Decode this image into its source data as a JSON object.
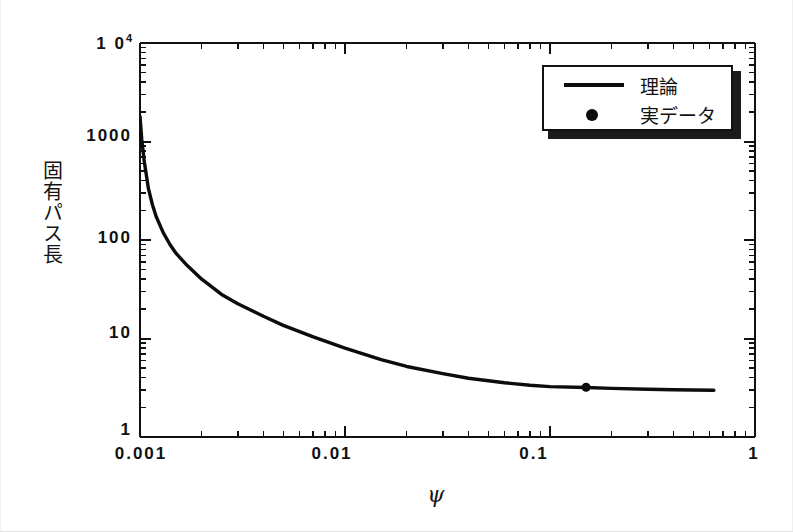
{
  "figure": {
    "background_color": "#ffffff",
    "ink_color": "#111111"
  },
  "axis": {
    "y_title": "固有パス長",
    "x_title": "ψ",
    "y_tick_labels": [
      "1",
      "10",
      "100",
      "1000",
      "10"
    ],
    "y_top_exponent": "4",
    "x_tick_labels": [
      "0.001",
      "0.01",
      "0.1",
      "1"
    ]
  },
  "legend": {
    "items": [
      {
        "label": "理論",
        "marker": "line",
        "color": "#0c0c0c"
      },
      {
        "label": "実データ",
        "marker": "dot",
        "color": "#0c0c0c"
      }
    ]
  },
  "chart_data": {
    "type": "line",
    "title": "",
    "subtitle": "",
    "xlabel": "ψ",
    "ylabel": "固有パス長",
    "xscale": "log",
    "yscale": "log",
    "xlim": [
      0.001,
      1
    ],
    "ylim": [
      1,
      10000
    ],
    "xticks": [
      0.001,
      0.01,
      0.1,
      1
    ],
    "xtick_labels": [
      "0.001",
      "0.01",
      "0.1",
      "1"
    ],
    "yticks": [
      1,
      10,
      100,
      1000,
      10000
    ],
    "ytick_labels": [
      "1",
      "10",
      "100",
      "1000",
      "10^4"
    ],
    "grid": false,
    "minor_ticks": true,
    "tick_direction": "in",
    "legend_position": "top-right",
    "series": [
      {
        "name": "理論",
        "type": "line",
        "color": "#0c0c0c",
        "linewidth": 3,
        "x": [
          0.001,
          0.00102,
          0.00105,
          0.0011,
          0.00115,
          0.0012,
          0.0013,
          0.0014,
          0.0015,
          0.0017,
          0.002,
          0.0025,
          0.003,
          0.004,
          0.005,
          0.007,
          0.01,
          0.015,
          0.02,
          0.03,
          0.04,
          0.06,
          0.08,
          0.1,
          0.15,
          0.2,
          0.3,
          0.4,
          0.5,
          0.63
        ],
        "y": [
          1800,
          1050,
          620,
          330,
          228,
          172,
          118,
          90,
          73,
          55,
          40,
          28,
          22.5,
          16.8,
          13.6,
          10.4,
          8.0,
          6.1,
          5.2,
          4.4,
          3.95,
          3.55,
          3.35,
          3.25,
          3.18,
          3.12,
          3.05,
          3.02,
          3.0,
          2.98
        ]
      },
      {
        "name": "実データ",
        "type": "scatter",
        "color": "#0c0c0c",
        "marker_size": 9,
        "x": [
          0.15
        ],
        "y": [
          3.2
        ]
      }
    ]
  }
}
